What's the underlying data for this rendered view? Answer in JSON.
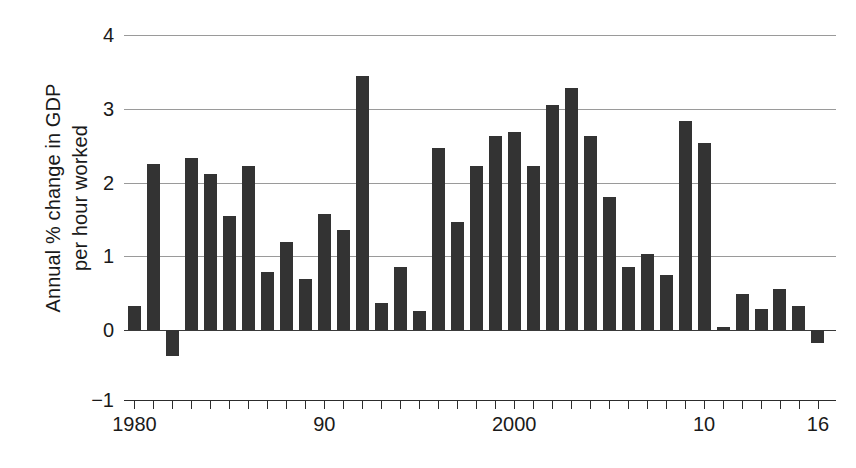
{
  "chart_data": {
    "type": "bar",
    "title": "",
    "xlabel": "",
    "ylabel": "Annual % change in GDP per hour worked",
    "ylabel_line1": "Annual % change in GDP",
    "ylabel_line2": "per hour worked",
    "ylim": [
      -1,
      4
    ],
    "xlim": [
      1979.5,
      2016.5
    ],
    "grid": true,
    "gridlines": [
      0,
      1,
      2,
      3,
      4
    ],
    "y_ticks": [
      -1,
      0,
      1,
      2,
      3,
      4
    ],
    "y_tick_labels": [
      "−1",
      "0",
      "1",
      "2",
      "3",
      "4"
    ],
    "legend": null,
    "bar_color": "#333333",
    "axis_color": "#2c2c2c",
    "grid_color": "#9a9a9a",
    "x_tick_years": [
      1980,
      1981,
      1982,
      1983,
      1984,
      1985,
      1986,
      1987,
      1988,
      1989,
      1990,
      1991,
      1992,
      1993,
      1994,
      1995,
      1996,
      1997,
      1998,
      1999,
      2000,
      2001,
      2002,
      2003,
      2004,
      2005,
      2006,
      2007,
      2008,
      2009,
      2010,
      2011,
      2012,
      2013,
      2014,
      2015,
      2016
    ],
    "x_tick_labels": [
      {
        "year": 1980,
        "label": "1980"
      },
      {
        "year": 1990,
        "label": "90"
      },
      {
        "year": 2000,
        "label": "2000"
      },
      {
        "year": 2010,
        "label": "10"
      },
      {
        "year": 2016,
        "label": "16"
      }
    ],
    "categories": [
      1980,
      1981,
      1982,
      1983,
      1984,
      1985,
      1986,
      1987,
      1988,
      1989,
      1990,
      1991,
      1992,
      1993,
      1994,
      1995,
      1996,
      1997,
      1998,
      1999,
      2000,
      2001,
      2002,
      2003,
      2004,
      2005,
      2006,
      2007,
      2008,
      2009,
      2010,
      2011,
      2012,
      2013,
      2014,
      2015,
      2016
    ],
    "values": [
      0.33,
      2.25,
      -0.35,
      2.33,
      2.12,
      1.55,
      2.22,
      0.78,
      1.2,
      0.69,
      1.57,
      1.35,
      3.45,
      0.37,
      0.86,
      0.26,
      2.47,
      1.47,
      2.23,
      2.63,
      2.68,
      2.23,
      3.05,
      3.28,
      2.63,
      1.81,
      0.85,
      1.03,
      0.75,
      2.84,
      2.53,
      0.04,
      0.49,
      0.28,
      0.55,
      0.33,
      -0.18
    ]
  }
}
